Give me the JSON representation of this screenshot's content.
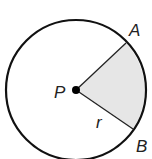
{
  "diagram": {
    "labels": {
      "center": "P",
      "point_a": "A",
      "point_b": "B",
      "radius": "r"
    },
    "colors": {
      "stroke": "#111111",
      "sector_fill": "#e6e6e6",
      "background": "#ffffff"
    }
  }
}
